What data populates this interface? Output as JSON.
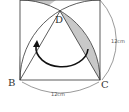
{
  "diagram": {
    "type": "geometry",
    "points": {
      "B": {
        "label": "B"
      },
      "C": {
        "label": "C"
      },
      "D": {
        "label": "D"
      }
    },
    "dimensions": {
      "bottom": "12cm",
      "right": "12cm"
    },
    "colors": {
      "line": "#333333",
      "shade": "#c8c8c8",
      "arrow": "#111111",
      "background": "#ffffff"
    }
  }
}
